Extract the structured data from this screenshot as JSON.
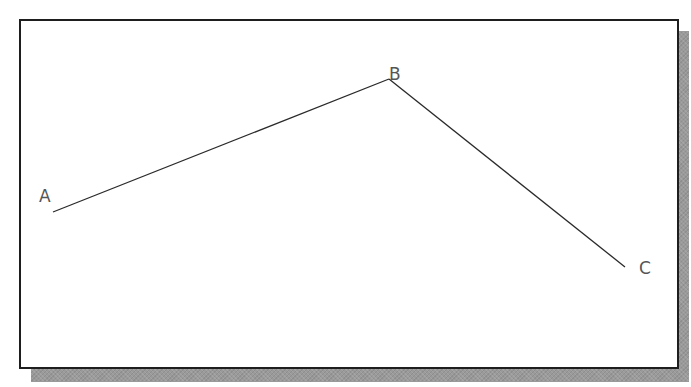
{
  "diagram": {
    "type": "polyline",
    "points": [
      {
        "id": "A",
        "label": "A",
        "x": 53,
        "y": 212,
        "label_x": 39,
        "label_y": 202
      },
      {
        "id": "B",
        "label": "B",
        "x": 389,
        "y": 79,
        "label_x": 389,
        "label_y": 80
      },
      {
        "id": "C",
        "label": "C",
        "x": 625,
        "y": 267,
        "label_x": 639,
        "label_y": 274
      }
    ],
    "segments": [
      {
        "from": "A",
        "to": "B"
      },
      {
        "from": "B",
        "to": "C"
      }
    ],
    "colors": {
      "line": "#2a2a2a",
      "label": "#555555",
      "frame_border": "#1e1e1e",
      "shadow": "#9a9a9a",
      "background": "#ffffff"
    }
  }
}
